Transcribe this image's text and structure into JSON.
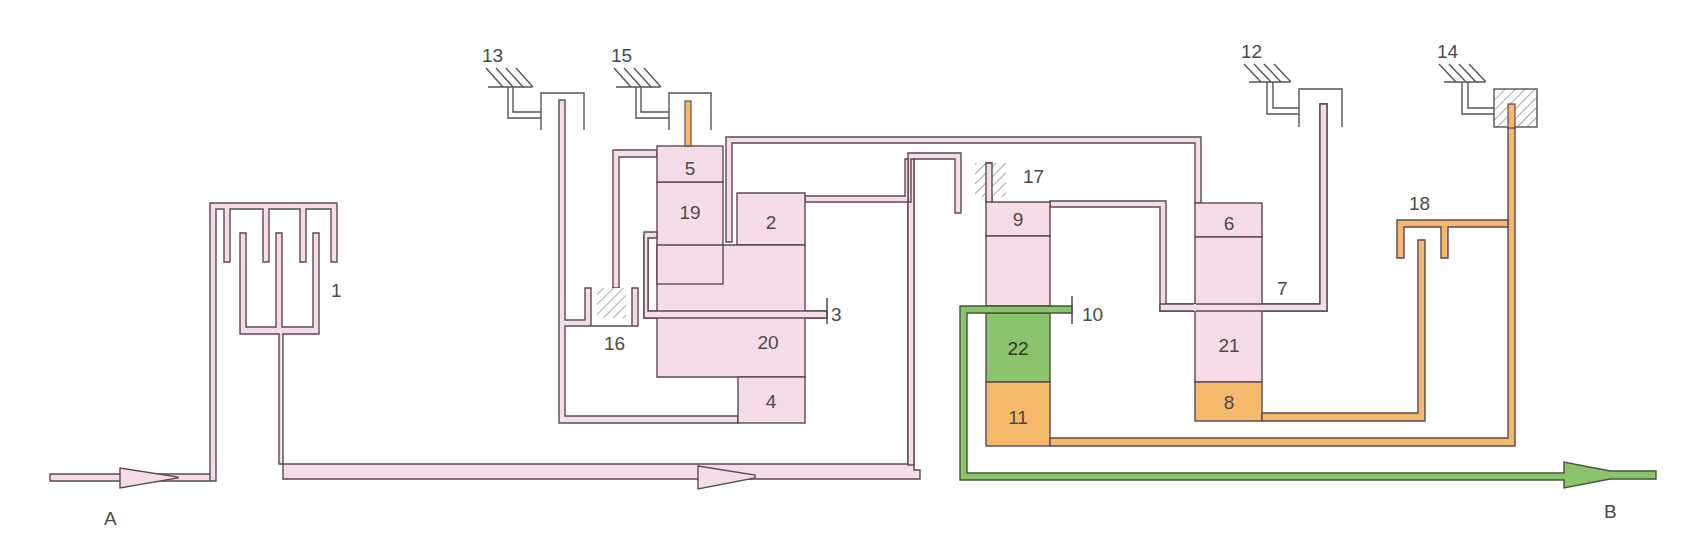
{
  "colors": {
    "pink": "#f6dce8",
    "orange": "#f5b96c",
    "green": "#8cc46e",
    "outline": "#5a4a55",
    "background": "#ffffff"
  },
  "io_labels": {
    "input": "A",
    "output": "B"
  },
  "components": [
    {
      "id": "1",
      "label": "1"
    },
    {
      "id": "2",
      "label": "2"
    },
    {
      "id": "3",
      "label": "3"
    },
    {
      "id": "4",
      "label": "4"
    },
    {
      "id": "5",
      "label": "5"
    },
    {
      "id": "6",
      "label": "6"
    },
    {
      "id": "7",
      "label": "7"
    },
    {
      "id": "8",
      "label": "8"
    },
    {
      "id": "9",
      "label": "9"
    },
    {
      "id": "10",
      "label": "10"
    },
    {
      "id": "11",
      "label": "11"
    },
    {
      "id": "12",
      "label": "12"
    },
    {
      "id": "13",
      "label": "13"
    },
    {
      "id": "14",
      "label": "14"
    },
    {
      "id": "15",
      "label": "15"
    },
    {
      "id": "16",
      "label": "16"
    },
    {
      "id": "17",
      "label": "17"
    },
    {
      "id": "18",
      "label": "18"
    },
    {
      "id": "19",
      "label": "19"
    },
    {
      "id": "20",
      "label": "20"
    },
    {
      "id": "21",
      "label": "21"
    },
    {
      "id": "22",
      "label": "22"
    }
  ],
  "labels": {
    "l1": "1",
    "l2": "2",
    "l3": "3",
    "l4": "4",
    "l5": "5",
    "l6": "6",
    "l7": "7",
    "l8": "8",
    "l9": "9",
    "l10": "10",
    "l11": "11",
    "l12": "12",
    "l13": "13",
    "l14": "14",
    "l15": "15",
    "l16": "16",
    "l17": "17",
    "l18": "18",
    "l19": "19",
    "l20": "20",
    "l21": "21",
    "l22": "22",
    "A": "A",
    "B": "B"
  }
}
